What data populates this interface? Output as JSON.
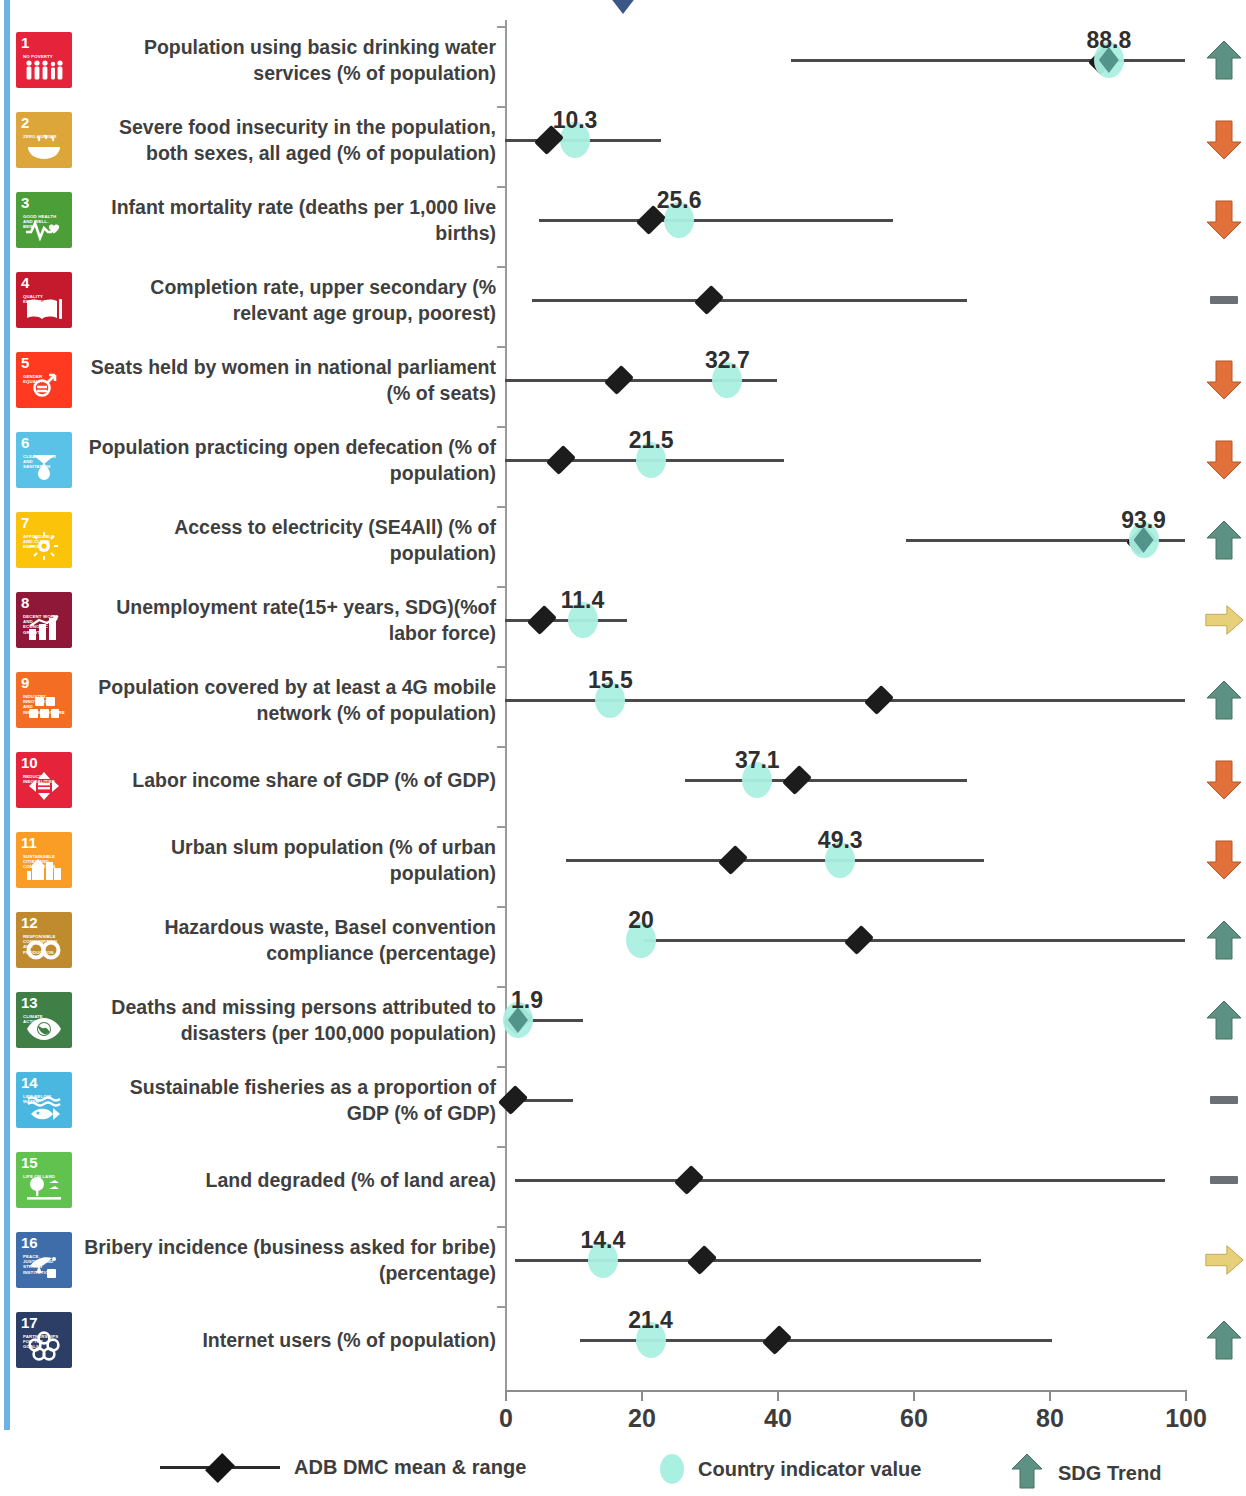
{
  "axis": {
    "ticks": [
      0,
      20,
      40,
      60,
      80,
      100
    ],
    "min": 0,
    "max": 100
  },
  "legend": {
    "mean_range": "ADB DMC mean & range",
    "country_value": "Country indicator value",
    "sdg_trend": "SDG Trend"
  },
  "colors": {
    "country_dot": "#aaf0e0",
    "mean_diamond": "#141414",
    "trend_up": "#5c9183",
    "trend_down": "#e2703a",
    "trend_flat": "#6b6f76",
    "trend_side": "#e8cf7a",
    "left_strip": "#6cb3e4",
    "top_diamond": "#3a5788"
  },
  "chart_data": {
    "type": "scatter",
    "title": "",
    "xlabel": "",
    "ylabel": "",
    "xlim": [
      0,
      100
    ],
    "grid": false,
    "legend_position": "bottom",
    "series": [
      {
        "name": "ADB DMC mean & range",
        "type": "range-with-mean"
      },
      {
        "name": "Country indicator value",
        "type": "point"
      }
    ],
    "rows": [
      {
        "goal": 1,
        "goal_title": "NO POVERTY",
        "color": "#e5243b",
        "label": "Population using basic drinking water services (% of population)",
        "country_value": 88.8,
        "country_value_label": "88.8",
        "mean": 88.0,
        "range_min": 42.0,
        "range_max": 100.0,
        "trend": "up",
        "dot_style": "solid"
      },
      {
        "goal": 2,
        "goal_title": "ZERO HUNGER",
        "color": "#dda63a",
        "label": "Severe food insecurity in the population, both sexes, all aged (% of population)",
        "country_value": 10.3,
        "country_value_label": "10.3",
        "mean": 6.5,
        "range_min": 0.0,
        "range_max": 23.0,
        "trend": "down",
        "dot_style": "halo"
      },
      {
        "goal": 3,
        "goal_title": "GOOD HEALTH AND WELL-BEING",
        "color": "#4c9f38",
        "label": "Infant mortality rate (deaths per 1,000 live births)",
        "country_value": 25.6,
        "country_value_label": "25.6",
        "mean": 21.5,
        "range_min": 5.0,
        "range_max": 57.0,
        "trend": "down",
        "dot_style": "halo"
      },
      {
        "goal": 4,
        "goal_title": "QUALITY EDUCATION",
        "color": "#c5192d",
        "label": "Completion rate, upper secondary (% relevant age group, poorest)",
        "country_value": null,
        "country_value_label": "",
        "mean": 30.0,
        "range_min": 4.0,
        "range_max": 68.0,
        "trend": "flat",
        "dot_style": "none"
      },
      {
        "goal": 5,
        "goal_title": "GENDER EQUALITY",
        "color": "#ff3a21",
        "label": "Seats held by women in national parliament (% of seats)",
        "country_value": 32.7,
        "country_value_label": "32.7",
        "mean": 16.8,
        "range_min": 0.0,
        "range_max": 40.0,
        "trend": "down",
        "dot_style": "halo"
      },
      {
        "goal": 6,
        "goal_title": "CLEAN WATER AND SANITATION",
        "color": "#5bc2e7",
        "label": "Population practicing open defecation (% of population)",
        "country_value": 21.5,
        "country_value_label": "21.5",
        "mean": 8.2,
        "range_min": 0.0,
        "range_max": 41.0,
        "trend": "down",
        "dot_style": "halo"
      },
      {
        "goal": 7,
        "goal_title": "AFFORDABLE AND CLEAN ENERGY",
        "color": "#fcc30b",
        "label": "Access to electricity (SE4All) (% of population)",
        "country_value": 93.9,
        "country_value_label": "93.9",
        "mean": 93.5,
        "range_min": 59.0,
        "range_max": 100.0,
        "trend": "up",
        "dot_style": "solid"
      },
      {
        "goal": 8,
        "goal_title": "DECENT WORK AND ECONOMIC GROWTH",
        "color": "#8f1838",
        "label": "Unemployment rate(15+ years, SDG)(%of labor force)",
        "country_value": 11.4,
        "country_value_label": "11.4",
        "mean": 5.5,
        "range_min": 0.0,
        "range_max": 18.0,
        "trend": "side",
        "dot_style": "halo"
      },
      {
        "goal": 9,
        "goal_title": "INDUSTRY, INNOVATION AND INFRASTRUCTURE",
        "color": "#f36d25",
        "label": "Population covered by at least a 4G mobile network (% of population)",
        "country_value": 15.5,
        "country_value_label": "15.5",
        "mean": 55.0,
        "range_min": 0.0,
        "range_max": 100.0,
        "trend": "up",
        "dot_style": "halo"
      },
      {
        "goal": 10,
        "goal_title": "REDUCED INEQUALITIES",
        "color": "#e5243b",
        "label": "Labor income share of GDP (% of GDP)",
        "country_value": 37.1,
        "country_value_label": "37.1",
        "mean": 43.0,
        "range_min": 26.5,
        "range_max": 68.0,
        "trend": "down",
        "dot_style": "halo"
      },
      {
        "goal": 11,
        "goal_title": "SUSTAINABLE CITIES AND COMMUNITIES",
        "color": "#f99d26",
        "label": "Urban slum population (% of urban population)",
        "country_value": 49.3,
        "country_value_label": "49.3",
        "mean": 33.5,
        "range_min": 9.0,
        "range_max": 70.5,
        "trend": "down",
        "dot_style": "halo"
      },
      {
        "goal": 12,
        "goal_title": "RESPONSIBLE CONSUMPTION AND PRODUCTION",
        "color": "#bf8b2e",
        "label": "Hazardous waste, Basel convention compliance (percentage)",
        "country_value": 20.0,
        "country_value_label": "20",
        "mean": 52.0,
        "range_min": 20.5,
        "range_max": 100.0,
        "trend": "up",
        "dot_style": "halo"
      },
      {
        "goal": 13,
        "goal_title": "CLIMATE ACTION",
        "color": "#407f46",
        "label": "Deaths and missing persons attributed to disasters (per 100,000 population)",
        "country_value": 1.9,
        "country_value_label": "1.9",
        "mean": 1.9,
        "range_min": 0.0,
        "range_max": 11.5,
        "trend": "up",
        "dot_style": "solid"
      },
      {
        "goal": 14,
        "goal_title": "LIFE BELOW WATER",
        "color": "#4ab7e0",
        "label": "Sustainable fisheries as a proportion of GDP (% of GDP)",
        "country_value": null,
        "country_value_label": "",
        "mean": 1.2,
        "range_min": 0.0,
        "range_max": 10.0,
        "trend": "flat",
        "dot_style": "none"
      },
      {
        "goal": 15,
        "goal_title": "LIFE ON LAND",
        "color": "#61c250",
        "label": "Land degraded (% of land area)",
        "country_value": null,
        "country_value_label": "",
        "mean": 27.0,
        "range_min": 1.5,
        "range_max": 97.0,
        "trend": "flat",
        "dot_style": "none"
      },
      {
        "goal": 16,
        "goal_title": "PEACE, JUSTICE AND STRONG INSTITUTIONS",
        "color": "#3f6daa",
        "label": "Bribery incidence (business asked for bribe) (percentage)",
        "country_value": 14.4,
        "country_value_label": "14.4",
        "mean": 29.0,
        "range_min": 1.5,
        "range_max": 70.0,
        "trend": "side",
        "dot_style": "halo"
      },
      {
        "goal": 17,
        "goal_title": "PARTNERSHIPS FOR THE GOALS",
        "color": "#2c3e66",
        "label": "Internet users (% of population)",
        "country_value": 21.4,
        "country_value_label": "21.4",
        "mean": 40.0,
        "range_min": 11.0,
        "range_max": 80.5,
        "trend": "up",
        "dot_style": "halo"
      }
    ]
  }
}
